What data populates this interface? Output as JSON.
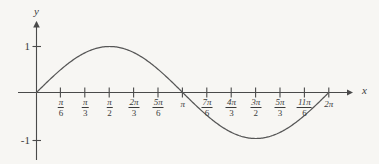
{
  "figure": {
    "background_color": "#f7f6f3",
    "curve_color": "#565656",
    "axis_color": "#4a4a4a",
    "text_color": "#3b3b3b"
  },
  "axes": {
    "x_axis_label": "x",
    "y_axis_label": "y",
    "x_axis_name": "x-axis",
    "y_axis_name": "y-axis"
  },
  "y_ticks": [
    {
      "label": "1",
      "value": 1
    },
    {
      "label": "-1",
      "value": -1
    }
  ],
  "x_ticks": [
    {
      "numerator": "π",
      "denominator": "6",
      "is_fraction": true,
      "label": "π/6",
      "value": 0.5235987756
    },
    {
      "numerator": "π",
      "denominator": "3",
      "is_fraction": true,
      "label": "π/3",
      "value": 1.0471975512
    },
    {
      "numerator": "π",
      "denominator": "2",
      "is_fraction": true,
      "label": "π/2",
      "value": 1.5707963268
    },
    {
      "numerator": "2π",
      "denominator": "3",
      "is_fraction": true,
      "label": "2π/3",
      "value": 2.0943951024
    },
    {
      "numerator": "5π",
      "denominator": "6",
      "is_fraction": true,
      "label": "5π/6",
      "value": 2.617993878
    },
    {
      "numerator": "π",
      "denominator": "",
      "is_fraction": false,
      "label": "π",
      "value": 3.1415926536
    },
    {
      "numerator": "7π",
      "denominator": "6",
      "is_fraction": true,
      "label": "7π/6",
      "value": 3.6651914292
    },
    {
      "numerator": "4π",
      "denominator": "3",
      "is_fraction": true,
      "label": "4π/3",
      "value": 4.1887902048
    },
    {
      "numerator": "3π",
      "denominator": "2",
      "is_fraction": true,
      "label": "3π/2",
      "value": 4.7123889804
    },
    {
      "numerator": "5π",
      "denominator": "3",
      "is_fraction": true,
      "label": "5π/3",
      "value": 5.235987756
    },
    {
      "numerator": "11π",
      "denominator": "6",
      "is_fraction": true,
      "label": "11π/6",
      "value": 5.7595865316
    },
    {
      "numerator": "2π",
      "denominator": "",
      "is_fraction": false,
      "label": "2π",
      "value": 6.2831853072
    }
  ],
  "chart_data": {
    "type": "line",
    "title": "",
    "xlabel": "x",
    "ylabel": "y",
    "xlim": [
      0,
      6.2831853072
    ],
    "ylim": [
      -1,
      1
    ],
    "grid": false,
    "legend": "none",
    "series": [
      {
        "name": "y = sin(x)",
        "function": "sin(x)",
        "x": [
          0,
          0.5235987756,
          1.0471975512,
          1.5707963268,
          2.0943951024,
          2.617993878,
          3.1415926536,
          3.6651914292,
          4.1887902048,
          4.7123889804,
          5.235987756,
          5.7595865316,
          6.2831853072
        ],
        "values": [
          0,
          0.5,
          0.866,
          1,
          0.866,
          0.5,
          0,
          -0.5,
          -0.866,
          -1,
          -0.866,
          -0.5,
          0
        ]
      }
    ],
    "xtick_labels": [
      "π/6",
      "π/3",
      "π/2",
      "2π/3",
      "5π/6",
      "π",
      "7π/6",
      "4π/3",
      "3π/2",
      "5π/3",
      "11π/6",
      "2π"
    ],
    "ytick_labels": [
      "1",
      "-1"
    ],
    "annotations": []
  }
}
